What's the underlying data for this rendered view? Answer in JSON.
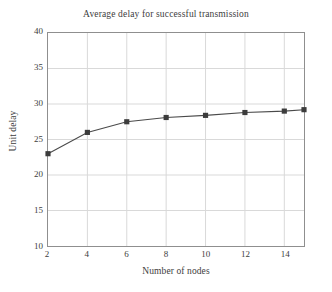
{
  "chart_data": {
    "type": "line",
    "title": "Average delay for successful transmission",
    "xlabel": "Number of nodes",
    "ylabel": "Unit delay",
    "x": [
      2,
      4,
      6,
      8,
      10,
      12,
      14,
      15
    ],
    "values": [
      23.0,
      26.0,
      27.5,
      28.1,
      28.4,
      28.8,
      29.0,
      29.2
    ],
    "series": [
      {
        "name": "Average delay",
        "x": [
          2,
          4,
          6,
          8,
          10,
          12,
          14,
          15
        ],
        "values": [
          23.0,
          26.0,
          27.5,
          28.1,
          28.4,
          28.8,
          29.0,
          29.2
        ]
      }
    ],
    "xlim": [
      2,
      15
    ],
    "ylim": [
      10,
      40
    ],
    "xticks": [
      2,
      4,
      6,
      8,
      10,
      12,
      14
    ],
    "yticks": [
      10,
      15,
      20,
      25,
      30,
      35,
      40
    ],
    "xtick_labels": [
      "2",
      "4",
      "6",
      "8",
      "10",
      "12",
      "14"
    ],
    "ytick_labels": [
      "10",
      "15",
      "20",
      "25",
      "30",
      "35",
      "40"
    ],
    "grid": true,
    "grid_color": "#d9d9d9",
    "legend": "none",
    "line_color": "#4a4a4a",
    "marker": "square",
    "marker_color": "#3c3c3c",
    "frame_color": "#8f8f8f",
    "background": "#ffffff"
  }
}
